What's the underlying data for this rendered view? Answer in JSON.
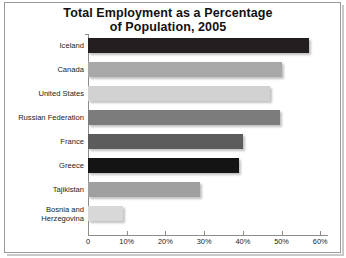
{
  "chart_data": {
    "type": "bar",
    "orientation": "horizontal",
    "title": "Total Employment as a Percentage of Population, 2005",
    "title_line1": "Total Employment as a Percentage",
    "title_line2": "of Population, 2005",
    "xlabel": "",
    "ylabel": "",
    "xlim": [
      0,
      62
    ],
    "grid": false,
    "legend": "none",
    "xticks": [
      {
        "value": 0,
        "label": "0"
      },
      {
        "value": 10,
        "label": "10%"
      },
      {
        "value": 20,
        "label": "20%"
      },
      {
        "value": 30,
        "label": "30%"
      },
      {
        "value": 40,
        "label": "40%"
      },
      {
        "value": 50,
        "label": "50%"
      },
      {
        "value": 60,
        "label": "60%"
      }
    ],
    "categories": [
      "Iceland",
      "Canada",
      "United States",
      "Russian Federation",
      "France",
      "Greece",
      "Tajikistan",
      "Bosnia and Herzegovina"
    ],
    "values": [
      57,
      50,
      47,
      49.5,
      40,
      39,
      29,
      9
    ],
    "colors": [
      "#231f20",
      "#a8a8a8",
      "#d2d2d2",
      "#7c7c7c",
      "#5c5c5c",
      "#141414",
      "#a0a0a0",
      "#d8d8d8"
    ],
    "bars": [
      {
        "category": "Iceland",
        "label_lines": [
          "Iceland"
        ],
        "value": 57,
        "color": "#231f20"
      },
      {
        "category": "Canada",
        "label_lines": [
          "Canada"
        ],
        "value": 50,
        "color": "#a8a8a8"
      },
      {
        "category": "United States",
        "label_lines": [
          "United States"
        ],
        "value": 47,
        "color": "#d2d2d2"
      },
      {
        "category": "Russian Federation",
        "label_lines": [
          "Russian Federation"
        ],
        "value": 49.5,
        "color": "#7c7c7c"
      },
      {
        "category": "France",
        "label_lines": [
          "France"
        ],
        "value": 40,
        "color": "#5c5c5c"
      },
      {
        "category": "Greece",
        "label_lines": [
          "Greece"
        ],
        "value": 39,
        "color": "#141414"
      },
      {
        "category": "Tajikistan",
        "label_lines": [
          "Tajikistan"
        ],
        "value": 29,
        "color": "#a0a0a0"
      },
      {
        "category": "Bosnia and Herzegovina",
        "label_lines": [
          "Bosnia and",
          "Herzegovina"
        ],
        "value": 9,
        "color": "#d8d8d8"
      }
    ]
  }
}
